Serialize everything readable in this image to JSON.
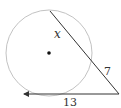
{
  "diagram": {
    "type": "circle-secant-tangent",
    "circle": {
      "cx": 49,
      "cy": 53,
      "r": 43,
      "stroke": "#bbbbbb"
    },
    "center_dot": {
      "cx": 49,
      "cy": 53,
      "r": 1.8,
      "fill": "#111111"
    },
    "secant": {
      "x1": 50,
      "y1": 11,
      "x2": 119,
      "y2": 94,
      "stroke": "#333333"
    },
    "tangent": {
      "x1": 119,
      "y1": 94,
      "x2": 22,
      "y2": 94,
      "stroke": "#333333"
    },
    "labels": {
      "internal_segment": "x",
      "external_segment": "7",
      "tangent_length": "13"
    }
  }
}
